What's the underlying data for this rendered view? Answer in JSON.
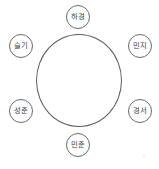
{
  "diagram": {
    "type": "sociogram",
    "shape": "circle-with-satellite-nodes",
    "center": {
      "name": "main-circle",
      "label": ""
    },
    "nodes": [
      {
        "id": "node-top",
        "label": "하경",
        "position": "top"
      },
      {
        "id": "node-upleft",
        "label": "슬기",
        "position": "upper-left"
      },
      {
        "id": "node-upright",
        "label": "민지",
        "position": "upper-right"
      },
      {
        "id": "node-lowleft",
        "label": "성준",
        "position": "lower-left"
      },
      {
        "id": "node-lowright",
        "label": "경서",
        "position": "lower-right"
      },
      {
        "id": "node-bottom",
        "label": "민준",
        "position": "bottom"
      }
    ],
    "colors": {
      "stroke": "#5a5a5a",
      "node_stroke": "#6b6b6b",
      "text": "#3d3d3d",
      "background": "#ffffff"
    }
  }
}
